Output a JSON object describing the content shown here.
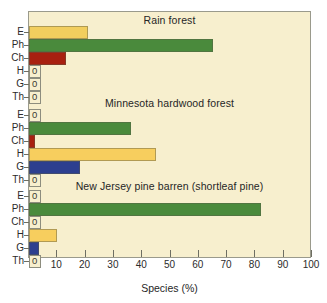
{
  "chart_data": {
    "type": "bar",
    "orientation": "horizontal",
    "title": "",
    "xlabel": "Species (%)",
    "ylabel": "",
    "xlim": [
      0,
      100
    ],
    "xticks": [
      0,
      10,
      20,
      30,
      40,
      50,
      60,
      70,
      80,
      90,
      100
    ],
    "xticklabels": [
      "",
      "10",
      "20",
      "30",
      "40",
      "50",
      "60",
      "70",
      "80",
      "90",
      "100"
    ],
    "grid": false,
    "legend": "none",
    "categories": [
      "E",
      "Ph",
      "Ch",
      "H",
      "G",
      "Th"
    ],
    "panels": [
      {
        "title": "Rain forest",
        "values": [
          21,
          65,
          13,
          0,
          0,
          0
        ]
      },
      {
        "title": "Minnesota hardwood forest",
        "values": [
          0,
          36,
          2,
          45,
          18,
          0
        ]
      },
      {
        "title": "New Jersey pine barren  (shortleaf pine)",
        "values": [
          0,
          82,
          0,
          10,
          3.5,
          0
        ]
      }
    ],
    "zero_label": "0",
    "colors": {
      "E": "#f2ce5e",
      "Ph": "#4a8a3c",
      "Ch": "#a82010",
      "H": "#f7ce5e",
      "G": "#2d3f8f",
      "Th": "#f7efce",
      "background": "#f7efce",
      "frame": "#9a9a8c",
      "text": "#262626"
    }
  }
}
